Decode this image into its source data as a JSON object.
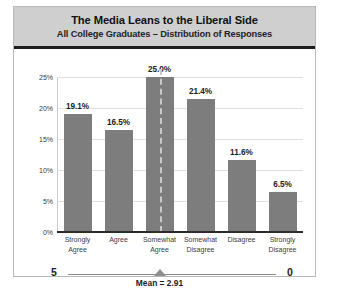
{
  "chart_data": {
    "type": "bar",
    "title": "The Media Leans to the Liberal Side",
    "subtitle": "All College Graduates – Distribution of Responses",
    "categories": [
      "Strongly\nAgree",
      "Agree",
      "Somewhat\nAgree",
      "Somewhat\nDisagree",
      "Disagree",
      "Strongly\nDisagree"
    ],
    "category_lines": [
      [
        "Strongly",
        "Agree"
      ],
      [
        "Agree",
        ""
      ],
      [
        "Somewhat",
        "Agree"
      ],
      [
        "Somewhat",
        "Disagree"
      ],
      [
        "Disagree",
        ""
      ],
      [
        "Strongly",
        "Disagree"
      ]
    ],
    "values": [
      19.1,
      16.5,
      25.0,
      21.4,
      11.6,
      6.5
    ],
    "value_labels": [
      "19.1%",
      "16.5%",
      "25.0%",
      "21.4%",
      "11.6%",
      "6.5%"
    ],
    "xlabel": "",
    "ylabel": "",
    "ylim": [
      0,
      25
    ],
    "ytick_values": [
      0,
      5,
      10,
      15,
      20,
      25
    ],
    "ytick_labels": [
      "0%",
      "5%",
      "10%",
      "15%",
      "20%",
      "25%"
    ],
    "grid": true,
    "legend": false,
    "bar_color": "#7d7d7d",
    "gridline_color": "#dedede",
    "annotations": {
      "mean_value": 2.91,
      "mean_caption": "Mean = 2.91",
      "scale_left_label": "5",
      "scale_right_label": "0",
      "mean_line_category_index": 2
    }
  },
  "header": {
    "title": "The Media Leans to the Liberal Side",
    "subtitle": "All College Graduates – Distribution of Responses"
  }
}
